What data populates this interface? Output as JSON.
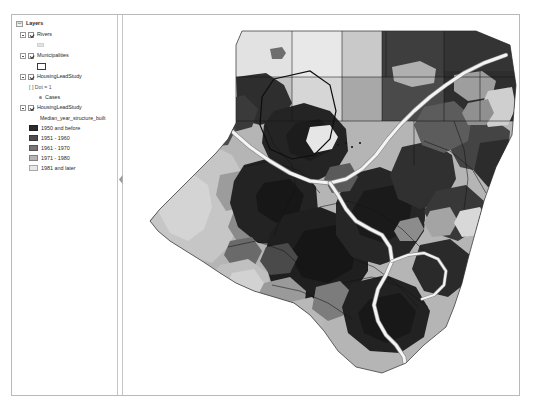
{
  "app": {
    "title": "Layers",
    "panel_name": "Table of Contents"
  },
  "toc": {
    "root": {
      "label": "Layers",
      "icon": "data-frame-icon",
      "checked": true,
      "expanded": true
    },
    "layers": [
      {
        "label": "Rivers",
        "icon": "layer-icon",
        "checked": true,
        "expanded": true,
        "symbol_type": "line",
        "symbol_color": "#e2e2e2",
        "symbols": []
      },
      {
        "label": "Municipalities",
        "icon": "layer-icon",
        "checked": true,
        "expanded": true,
        "symbol_type": "hollow-polygon",
        "symbol_color": "#ffffff",
        "symbol_outline": "#3a3a3a",
        "symbols": []
      },
      {
        "label": "HousingLeadStudy",
        "icon": "layer-icon",
        "checked": true,
        "expanded": true,
        "definition_query": "[ ] Dot = 1",
        "symbol_type": "point",
        "symbols": [
          {
            "label": "Cases",
            "color": "#8a8a8a"
          }
        ]
      },
      {
        "label": "HousingLeadStudy",
        "icon": "layer-icon",
        "checked": true,
        "expanded": true,
        "classification_field": "Median_year_structure_built",
        "symbol_type": "graduated-color",
        "symbols": [
          {
            "label": "1950 and before",
            "color": "#2b2b2b"
          },
          {
            "label": "1951 - 1960",
            "color": "#4e4e4e"
          },
          {
            "label": "1961 - 1970",
            "color": "#777777"
          },
          {
            "label": "1971 - 1980",
            "color": "#b5b5b5"
          },
          {
            "label": "1981 and later",
            "color": "#e8e8e8"
          }
        ]
      }
    ]
  },
  "splitter": {
    "name": "panel-collapse-handle",
    "icon": "chevron-left-icon"
  },
  "map": {
    "background": "#ffffff",
    "river_color": "#f0f0f0",
    "river_outline": "#8c8c8c",
    "boundary_color": "#1a1a1a",
    "class_colors": {
      "c1_1950_and_before": "#2b2b2b",
      "c2_1951_1960": "#4e4e4e",
      "c3_1961_1970": "#777777",
      "c4_1971_1980": "#b5b5b5",
      "c5_1981_and_later": "#e8e8e8"
    }
  }
}
